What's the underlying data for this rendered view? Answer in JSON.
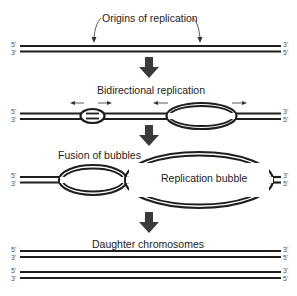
{
  "diagram": {
    "colors": {
      "strand": "#1e1e1e",
      "text": "#222222",
      "arrow": "#3a3a3a",
      "end_label": "#555555"
    },
    "stages": [
      {
        "id": "origins",
        "label": "Origins of replication",
        "top_strand": {
          "left": "5'",
          "right": "3'"
        },
        "bottom_strand": {
          "left": "3'",
          "right": "5'"
        }
      },
      {
        "id": "bidirectional",
        "label": "Bidirectional replication",
        "top_strand": {
          "left": "5'",
          "right": "3'"
        },
        "bottom_strand": {
          "left": "3'",
          "right": "5'"
        }
      },
      {
        "id": "fusion",
        "label": "Fusion of bubbles",
        "bubble_label": "Replication bubble",
        "top_strand": {
          "left": "5'",
          "right": "3'"
        },
        "bottom_strand": {
          "left": "3'",
          "right": "5'"
        }
      },
      {
        "id": "daughters",
        "label": "Daughter chromosomes",
        "chromosomes": [
          {
            "top_strand": {
              "left": "5'",
              "right": "3'"
            },
            "bottom_strand": {
              "left": "3'",
              "right": "5'"
            }
          },
          {
            "top_strand": {
              "left": "5'",
              "right": "3'"
            },
            "bottom_strand": {
              "left": "3'",
              "right": "5'"
            }
          }
        ]
      }
    ]
  }
}
